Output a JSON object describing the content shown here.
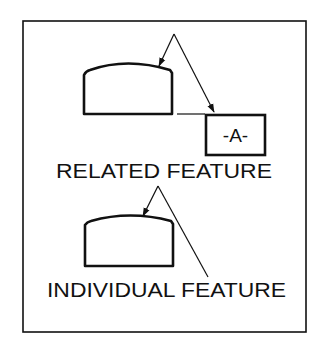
{
  "diagram": {
    "colors": {
      "background": "#ffffff",
      "ink": "#111111"
    },
    "related": {
      "label": "RELATED FEATURE",
      "datum_symbol": "-A-"
    },
    "individual": {
      "label": "INDIVIDUAL FEATURE"
    }
  }
}
